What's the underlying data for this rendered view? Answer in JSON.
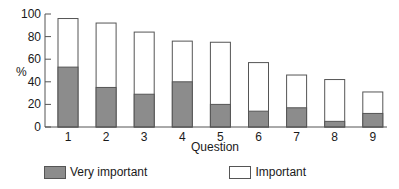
{
  "chart_data": {
    "type": "bar",
    "stacked": false,
    "overlay": true,
    "title": "",
    "xlabel": "Question",
    "ylabel": "%",
    "ylim": [
      0,
      100
    ],
    "yticks": [
      0,
      20,
      40,
      60,
      80,
      100
    ],
    "categories": [
      "1",
      "2",
      "3",
      "4",
      "5",
      "6",
      "7",
      "8",
      "9"
    ],
    "series": [
      {
        "name": "Important",
        "color": "#ffffff",
        "values": [
          96,
          92,
          84,
          76,
          75,
          57,
          46,
          42,
          31
        ]
      },
      {
        "name": "Very important",
        "color": "#8c8c8c",
        "values": [
          53,
          35,
          29,
          40,
          20,
          14,
          17,
          5,
          12
        ]
      }
    ],
    "legend_position": "bottom-left",
    "grid": false
  },
  "legend": {
    "items": [
      {
        "label": "Very important",
        "color": "#8c8c8c"
      },
      {
        "label": "Important",
        "color": "#ffffff"
      }
    ]
  }
}
